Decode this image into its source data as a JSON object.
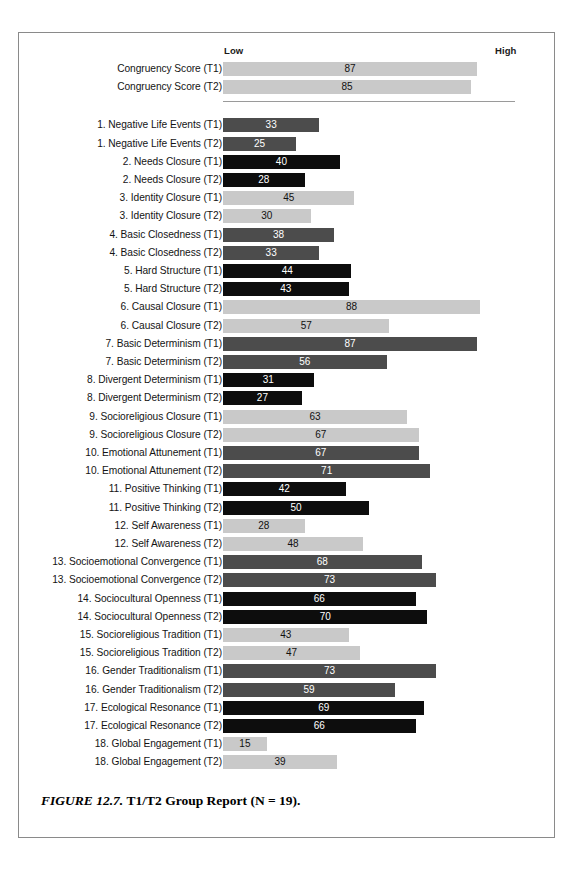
{
  "figure": {
    "caption_label": "FIGURE 12.7.",
    "caption_title": "T1/T2 Group Report (N = 19)."
  },
  "colors": {
    "light_gray": "#c9c9c9",
    "dark_gray": "#4c4c4c",
    "black": "#0d0d0d",
    "frame": "#8a8a8a",
    "divider": "#9a9a9a"
  },
  "chart_data": {
    "type": "bar",
    "orientation": "horizontal",
    "title": "T1/T2 Group Report (N = 19)",
    "xlabel": "",
    "ylabel": "",
    "xlim": [
      0,
      100
    ],
    "axis_tick_labels": [
      "Low",
      "High"
    ],
    "grid": false,
    "legend": "none",
    "value_labels": true,
    "categories": [
      "Congruency Score (T1)",
      "Congruency Score (T2)",
      "1. Negative Life Events (T1)",
      "1. Negative Life Events (T2)",
      "2. Needs Closure (T1)",
      "2. Needs Closure (T2)",
      "3. Identity Closure (T1)",
      "3. Identity Closure (T2)",
      "4. Basic Closedness (T1)",
      "4. Basic Closedness (T2)",
      "5. Hard Structure (T1)",
      "5. Hard Structure (T2)",
      "6. Causal Closure (T1)",
      "6. Causal Closure (T2)",
      "7. Basic Determinism (T1)",
      "7. Basic Determinism (T2)",
      "8. Divergent Determinism (T1)",
      "8. Divergent Determinism (T2)",
      "9. Socioreligious Closure (T1)",
      "9. Socioreligious Closure (T2)",
      "10. Emotional Attunement (T1)",
      "10. Emotional Attunement (T2)",
      "11. Positive Thinking (T1)",
      "11. Positive Thinking (T2)",
      "12. Self Awareness (T1)",
      "12. Self Awareness (T2)",
      "13. Socioemotional Convergence (T1)",
      "13. Socioemotional Convergence (T2)",
      "14. Sociocultural Openness (T1)",
      "14. Sociocultural Openness (T2)",
      "15. Socioreligious Tradition (T1)",
      "15. Socioreligious Tradition (T2)",
      "16. Gender Traditionalism (T1)",
      "16. Gender Traditionalism (T2)",
      "17. Ecological Resonance (T1)",
      "17. Ecological Resonance (T2)",
      "18. Global Engagement (T1)",
      "18. Global Engagement (T2)"
    ],
    "values": [
      87,
      85,
      33,
      25,
      40,
      28,
      45,
      30,
      38,
      33,
      44,
      43,
      88,
      57,
      87,
      56,
      31,
      27,
      63,
      67,
      67,
      71,
      42,
      50,
      28,
      48,
      68,
      73,
      66,
      70,
      43,
      47,
      73,
      59,
      69,
      66,
      15,
      39
    ],
    "bar_colors": [
      "light",
      "light",
      "dark",
      "dark",
      "black",
      "black",
      "light",
      "light",
      "dark",
      "dark",
      "black",
      "black",
      "light",
      "light",
      "dark",
      "dark",
      "black",
      "black",
      "light",
      "light",
      "dark",
      "dark",
      "black",
      "black",
      "light",
      "light",
      "dark",
      "dark",
      "black",
      "black",
      "light",
      "light",
      "dark",
      "dark",
      "black",
      "black",
      "light",
      "light"
    ],
    "section_break_after_index": 1
  }
}
